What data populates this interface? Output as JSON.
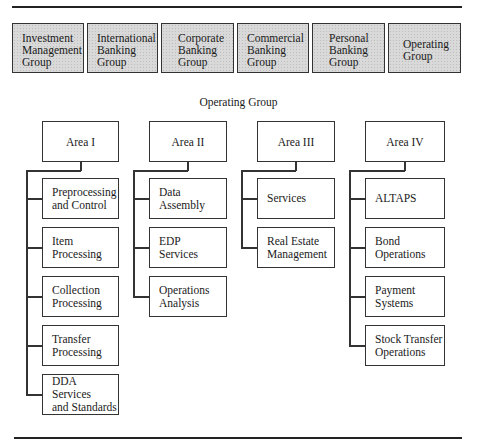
{
  "top_groups": [
    {
      "lines": [
        "Investment",
        "Management",
        "Group"
      ]
    },
    {
      "lines": [
        "International",
        "Banking",
        "Group"
      ]
    },
    {
      "lines": [
        "Corporate",
        "Banking",
        "Group"
      ]
    },
    {
      "lines": [
        "Commercial",
        "Banking",
        "Group"
      ]
    },
    {
      "lines": [
        "Personal",
        "Banking",
        "Group"
      ]
    },
    {
      "lines": [
        "Operating",
        "Group"
      ]
    }
  ],
  "section_heading": "Operating Group",
  "areas": [
    {
      "title": "Area I",
      "units": [
        {
          "lines": [
            "Preprocessing",
            "and Control"
          ]
        },
        {
          "lines": [
            "Item",
            "Processing"
          ]
        },
        {
          "lines": [
            "Collection",
            "Processing"
          ]
        },
        {
          "lines": [
            "Transfer",
            "Processing"
          ]
        },
        {
          "lines": [
            "DDA Services",
            "and Standards"
          ]
        }
      ]
    },
    {
      "title": "Area II",
      "units": [
        {
          "lines": [
            "Data",
            "Assembly"
          ]
        },
        {
          "lines": [
            "EDP",
            "Services"
          ]
        },
        {
          "lines": [
            "Operations",
            "Analysis"
          ]
        }
      ]
    },
    {
      "title": "Area III",
      "units": [
        {
          "lines": [
            "Services"
          ]
        },
        {
          "lines": [
            "Real Estate",
            "Management"
          ]
        }
      ]
    },
    {
      "title": "Area IV",
      "units": [
        {
          "lines": [
            "ALTAPS"
          ]
        },
        {
          "lines": [
            "Bond",
            "Operations"
          ]
        },
        {
          "lines": [
            "Payment",
            "Systems"
          ]
        },
        {
          "lines": [
            "Stock Transfer",
            "Operations"
          ]
        }
      ]
    }
  ]
}
